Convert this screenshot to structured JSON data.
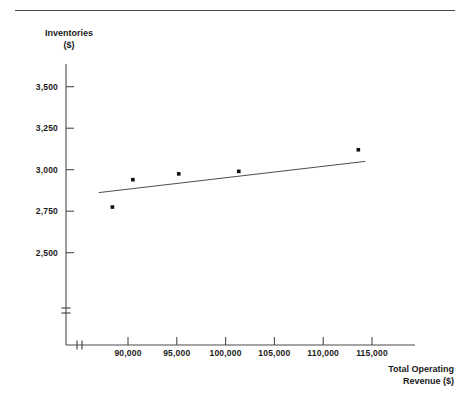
{
  "figure": {
    "top_rule": true,
    "background_color": "#ffffff",
    "ink_color": "#1a1a1a"
  },
  "axes": {
    "y_title_line1": "Inventories",
    "y_title_line2": "($)",
    "x_title_line1": "Total Operating",
    "x_title_line2": "Revenue ($)"
  },
  "chart_data": {
    "type": "scatter",
    "title": "",
    "subtitle": "",
    "xlabel": "Total Operating Revenue ($)",
    "ylabel": "Inventories ($)",
    "xlim": [
      86000,
      118000
    ],
    "ylim": [
      2400,
      3600
    ],
    "xticks": [
      90000,
      95000,
      100000,
      105000,
      110000,
      115000
    ],
    "xtick_labels": [
      "90,000",
      "95,000",
      "100,000",
      "105,000",
      "110,000",
      "115,000"
    ],
    "yticks": [
      2500,
      2750,
      3000,
      3250,
      3500
    ],
    "ytick_labels": [
      "2,500",
      "2,750",
      "3,000",
      "3,250",
      "3,500"
    ],
    "grid": false,
    "legend": null,
    "axis_break_x": true,
    "axis_break_y": true,
    "points": [
      {
        "x": 88400,
        "y": 2775
      },
      {
        "x": 90500,
        "y": 2940
      },
      {
        "x": 95200,
        "y": 2975
      },
      {
        "x": 101350,
        "y": 2990
      },
      {
        "x": 113600,
        "y": 3120
      }
    ],
    "series": [
      {
        "name": "Inventories",
        "x": [
          88400,
          90500,
          95200,
          101350,
          113600
        ],
        "values": [
          2775,
          2940,
          2975,
          2990,
          3120
        ]
      }
    ],
    "trendline": {
      "type": "line",
      "x": [
        87000,
        114300
      ],
      "y": [
        2862,
        3050
      ]
    }
  }
}
